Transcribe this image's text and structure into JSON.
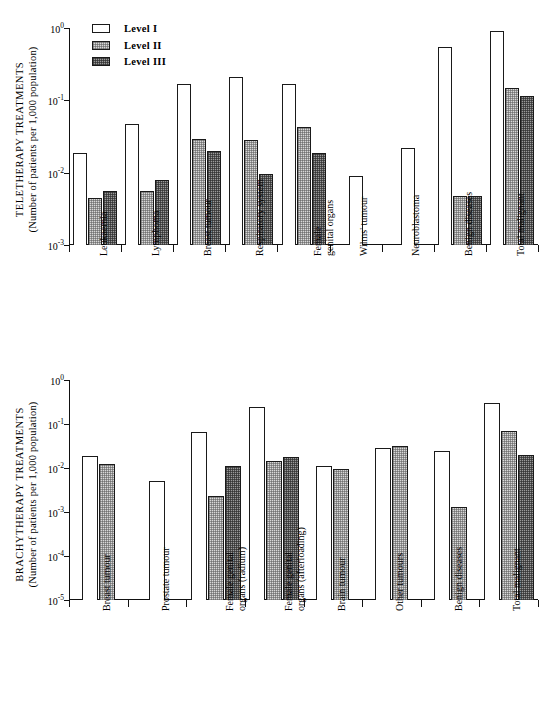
{
  "legend": {
    "items": [
      {
        "label": "Level  I",
        "fill": "white"
      },
      {
        "label": "Level  II",
        "fill": "light-dotted"
      },
      {
        "label": "Level  III",
        "fill": "dark-dotted"
      }
    ]
  },
  "colors": {
    "level_1": "#ffffff",
    "level_2": "#d8d8d8",
    "level_3": "#9a9a9a",
    "axis": "#111111",
    "background": "#ffffff"
  },
  "charts": [
    {
      "id": "teletherapy",
      "axis_title_line1": "TELETHERAPY TREATMENTS",
      "axis_title_line2": "(Number of patients per 1,000 population)",
      "ytick_labels": [
        "10",
        "10",
        "10",
        "10"
      ],
      "ytick_exponents": [
        "0",
        "-1",
        "-2",
        "-3"
      ],
      "chart_data": {
        "type": "bar",
        "title": "",
        "xlabel": "",
        "ylabel": "TELETHERAPY TREATMENTS (Number of patients per 1,000 population)",
        "yscale": "log",
        "ylim": [
          0.001,
          1
        ],
        "grid": false,
        "legend_position": "top-left",
        "categories": [
          "Leukaemia",
          "Lymphoma",
          "Breast tumour",
          "Respiratory system",
          "Female genital organs",
          "Wilms' tumour",
          "Neuroblastoma",
          "Benign diseases",
          "Total malignant"
        ],
        "series": [
          {
            "name": "Level I",
            "values": [
              0.019,
              0.047,
              0.17,
              0.21,
              0.17,
              0.009,
              0.022,
              0.55,
              0.9
            ]
          },
          {
            "name": "Level II",
            "values": [
              0.0045,
              0.0055,
              0.029,
              0.028,
              0.043,
              null,
              null,
              0.0048,
              0.15
            ]
          },
          {
            "name": "Level III",
            "values": [
              0.0055,
              0.008,
              0.02,
              0.0097,
              0.019,
              null,
              null,
              0.0047,
              0.115
            ]
          }
        ]
      }
    },
    {
      "id": "brachytherapy",
      "axis_title_line1": "BRACHYTHERAPY TREATMENTS",
      "axis_title_line2": "(Number of patients per 1,000 population)",
      "ytick_labels": [
        "10",
        "10",
        "10",
        "10",
        "10",
        "10"
      ],
      "ytick_exponents": [
        "0",
        "-1",
        "-2",
        "-3",
        "-4",
        "-5"
      ],
      "chart_data": {
        "type": "bar",
        "title": "",
        "xlabel": "",
        "ylabel": "BRACHYTHERAPY TREATMENTS (Number of patients per 1,000 population)",
        "yscale": "log",
        "ylim": [
          1e-05,
          1
        ],
        "grid": false,
        "legend_position": "none",
        "categories": [
          "Breast tumour",
          "Prostate tumour",
          "Female genital organs (radium)",
          "Female genital organs (afterloading)",
          "Brain tumour",
          "Other tumours",
          "Benign diseases",
          "Total malignant"
        ],
        "category_lines": [
          [
            "Breast  tumour"
          ],
          [
            "Prostate  tumour"
          ],
          [
            "Female  genital",
            "organs  (radium)"
          ],
          [
            "Female  genital",
            "organs  (afterloading)"
          ],
          [
            "Brain  tumour"
          ],
          [
            "Other  tumours"
          ],
          [
            "Benign  diseases"
          ],
          [
            "Total  malignant"
          ]
        ],
        "series": [
          {
            "name": "Level I",
            "values": [
              0.019,
              0.0052,
              0.065,
              0.24,
              0.011,
              0.029,
              0.024,
              0.3
            ]
          },
          {
            "name": "Level II",
            "values": [
              0.0125,
              null,
              0.0023,
              0.0145,
              0.0096,
              0.031,
              0.0013,
              0.07
            ]
          },
          {
            "name": "Level III",
            "values": [
              null,
              null,
              0.011,
              0.018,
              null,
              null,
              null,
              0.02
            ]
          }
        ]
      }
    }
  ],
  "top_category_lines": [
    [
      "Leukaemia"
    ],
    [
      "Lymphoma"
    ],
    [
      "Breast  tumour"
    ],
    [
      "Respiratory  system"
    ],
    [
      "Female",
      "genital  organs"
    ],
    [
      "Wilms'  tumour"
    ],
    [
      "Neuroblastoma"
    ],
    [
      "Benign  diseases"
    ],
    [
      "Total  malignant"
    ]
  ]
}
